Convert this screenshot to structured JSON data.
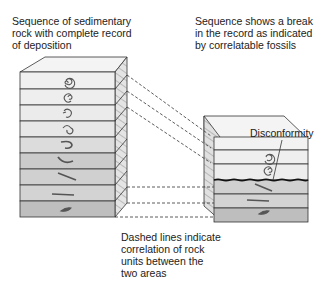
{
  "captions": {
    "left": [
      "Sequence of sedimentary",
      "rock with complete record",
      "of deposition"
    ],
    "right": [
      "Sequence shows a break",
      "in the record as indicated",
      "by correlatable fossils"
    ],
    "bottom": [
      "Dashed lines indicate",
      "correlation of rock",
      "units between the",
      "two areas"
    ]
  },
  "labels": {
    "disconformity": "Disconformity"
  },
  "left_column": {
    "layers": [
      {
        "fossil": "coiled-ammonite-large",
        "shade": "#efefef"
      },
      {
        "fossil": "coiled-ammonite-small",
        "shade": "#ededed"
      },
      {
        "fossil": "coiled-shell-open",
        "shade": "#eaeaea"
      },
      {
        "fossil": "coiled-shell-spiral",
        "shade": "#e6e6e6"
      },
      {
        "fossil": "hook-shell",
        "shade": "#dadada"
      },
      {
        "fossil": "curved-shell",
        "shade": "#c9c9c9"
      },
      {
        "fossil": "straight-shell-diagonal",
        "shade": "#cfcfcf"
      },
      {
        "fossil": "straight-shell-flat",
        "shade": "#d2d2d2"
      },
      {
        "fossil": "fish-fragment",
        "shade": "#bdbdbd"
      }
    ]
  },
  "right_column": {
    "layers": [
      {
        "fossil": "none",
        "shade": "#f0f0f0"
      },
      {
        "fossil": "coiled-ammonite-large",
        "shade": "#efefef"
      },
      {
        "fossil": "coiled-ammonite-small",
        "shade": "#ededed"
      },
      {
        "fossil": "straight-shell-diagonal",
        "shade": "#cfcfcf"
      },
      {
        "fossil": "straight-shell-flat",
        "shade": "#d2d2d2"
      },
      {
        "fossil": "fish-fragment",
        "shade": "#bdbdbd"
      }
    ]
  }
}
